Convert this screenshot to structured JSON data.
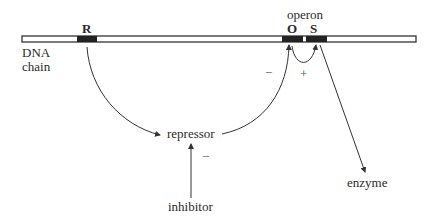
{
  "diagram": {
    "dna_label_line1": "DNA",
    "dna_label_line2": "chain",
    "operon_label": "operon",
    "genes": {
      "regulator": "R",
      "operator": "O",
      "structural": "S"
    },
    "nodes": {
      "repressor": "repressor",
      "inhibitor": "inhibitor",
      "enzyme": "enzyme"
    },
    "signs": {
      "repressor_to_operator": "−",
      "operator_to_structural": "+",
      "inhibitor_to_repressor": "−"
    },
    "edges": [
      {
        "from": "R",
        "to": "repressor",
        "sign": ""
      },
      {
        "from": "repressor",
        "to": "O",
        "sign": "−"
      },
      {
        "from": "O",
        "to": "S",
        "sign": "+"
      },
      {
        "from": "S",
        "to": "enzyme",
        "sign": ""
      },
      {
        "from": "inhibitor",
        "to": "repressor",
        "sign": "−"
      }
    ],
    "colors": {
      "line": "#333333",
      "gene_block": "#222222",
      "background": "#ffffff"
    }
  }
}
